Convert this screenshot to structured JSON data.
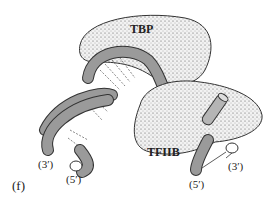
{
  "figure": {
    "panel_label": "(f)",
    "proteins": {
      "tbp": "TBP",
      "tfiib": "TFIIB"
    },
    "dna_ends": {
      "left_3": "(3′)",
      "left_5": "(5′)",
      "right_5": "(5′)",
      "right_3": "(3′)"
    }
  },
  "colors": {
    "dna_backbone": "#9a9a9a",
    "protein_fill": "#e4e4e4",
    "outline": "#333333"
  }
}
